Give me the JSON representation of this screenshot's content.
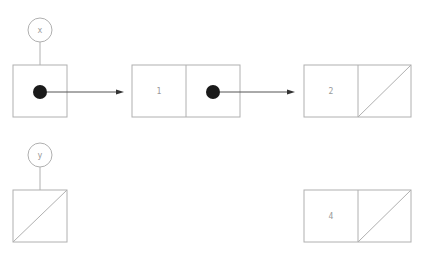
{
  "diagram": {
    "title": "",
    "variables": [
      {
        "name": "x",
        "circle": {
          "cx": 40,
          "cy": 30,
          "r": 12
        },
        "box": {
          "x": 13,
          "y": 65,
          "w": 54,
          "h": 52
        },
        "content": "pointer"
      },
      {
        "name": "y",
        "circle": {
          "cx": 40,
          "cy": 155,
          "r": 12
        },
        "box": {
          "x": 13,
          "y": 190,
          "w": 54,
          "h": 52
        },
        "content": "null"
      }
    ],
    "nodes": [
      {
        "id": "node1",
        "value": "1",
        "next": "pointer",
        "box": {
          "x": 132,
          "y": 65,
          "w": 108,
          "h": 52
        }
      },
      {
        "id": "node2",
        "value": "2",
        "next": "null",
        "box": {
          "x": 304,
          "y": 65,
          "w": 107,
          "h": 52
        }
      },
      {
        "id": "node4",
        "value": "4",
        "next": "null",
        "box": {
          "x": 304,
          "y": 190,
          "w": 107,
          "h": 52
        }
      }
    ],
    "arrows": [
      {
        "from": "x",
        "to": "node1"
      },
      {
        "from": "node1",
        "to": "node2"
      }
    ],
    "colors": {
      "stroke": "#b0b0b0",
      "pointer_dot": "#1a1a1a",
      "arrow": "#555555",
      "text": "#999999"
    }
  }
}
